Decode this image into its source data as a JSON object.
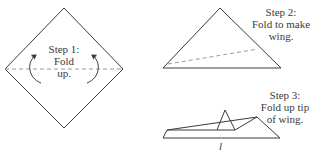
{
  "figure": {
    "title_partial": "ILLUSTRATION 1",
    "line_color": "#3a3a3a",
    "dash_color": "#9a9a9a"
  },
  "steps": [
    {
      "label": "Step 1:",
      "lines": [
        "Fold",
        "up."
      ]
    },
    {
      "label": "Step 2:",
      "lines": [
        "Fold to make",
        "wing."
      ]
    },
    {
      "label": "Step 3:",
      "lines": [
        "Fold up tip",
        "of wing."
      ]
    }
  ],
  "measurement_label": "l"
}
